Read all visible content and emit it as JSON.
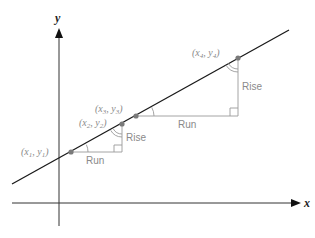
{
  "axes": {
    "x_label": "x",
    "y_label": "y"
  },
  "points": [
    {
      "label": "(x",
      "sub": "1",
      "sep": ", y",
      "sub2": "1",
      "close": ")"
    },
    {
      "label": "(x",
      "sub": "2",
      "sep": ", y",
      "sub2": "2",
      "close": ")"
    },
    {
      "label": "(x",
      "sub": "3",
      "sep": ", y",
      "sub2": "3",
      "close": ")"
    },
    {
      "label": "(x",
      "sub": "4",
      "sep": ", y",
      "sub2": "4",
      "close": ")"
    }
  ],
  "triangles": [
    {
      "run_label": "Run",
      "rise_label": "Rise"
    },
    {
      "run_label": "Run",
      "rise_label": "Rise"
    }
  ],
  "colors": {
    "line": "#1a1a1a",
    "axis": "#333333",
    "triangle": "#9a9a9a",
    "point": "#7a7a7a",
    "label": "#8a8a8a"
  }
}
